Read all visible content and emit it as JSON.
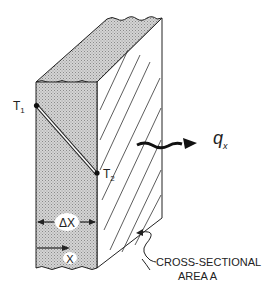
{
  "figure": {
    "labels": {
      "t1": "T",
      "t1_sub": "1",
      "t2": "T",
      "t2_sub": "2",
      "heat_flux": "q",
      "heat_flux_sub": "x",
      "thickness": "ΔX",
      "x_axis": "X",
      "area_line1": "CROSS-SECTIONAL",
      "area_line2": "AREA A"
    },
    "colors": {
      "shade": "#c8c8c8",
      "line": "#222222",
      "background": "#ffffff"
    }
  }
}
